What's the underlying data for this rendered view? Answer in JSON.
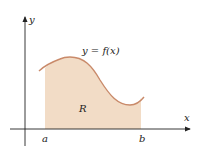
{
  "diagram": {
    "type": "area-under-curve",
    "axes": {
      "x_label": "x",
      "y_label": "y"
    },
    "curve_label": "y = f(x)",
    "region_label": "R",
    "bounds": {
      "left": "a",
      "right": "b"
    },
    "colors": {
      "fill": "#f2dcc6",
      "curve": "#c98a6a",
      "axis": "#222222"
    }
  }
}
